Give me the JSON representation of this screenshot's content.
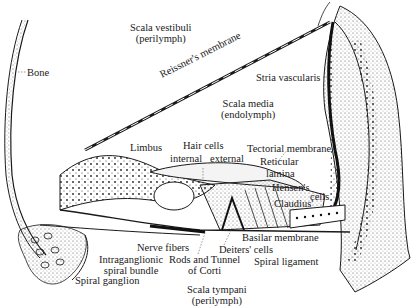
{
  "diagram": {
    "colors": {
      "ink": "#1a1a1a",
      "background": "#ffffff",
      "stipple": "#333333"
    },
    "compartments": [
      {
        "name": "Scala vestibuli",
        "fluid": "(perilymph)"
      },
      {
        "name": "Scala media",
        "fluid": "(endolymph)"
      },
      {
        "name": "Scala tympani",
        "fluid": "(perilymph)"
      }
    ],
    "labels": {
      "bone": "Bone",
      "reissners_membrane": "Reissner's membrane",
      "stria_vascularis": "Stria vascularis",
      "limbus": "Limbus",
      "hair_cells": "Hair cells",
      "internal": "internal",
      "external": "external",
      "tectorial_membrane": "Tectorial membrane",
      "reticular": "Reticular",
      "lamina": "lamina",
      "hensens": "Hensen's",
      "cells": "cells",
      "claudius": "Claudius'",
      "basilar_membrane": "Basilar membrane",
      "deiters_cells": "Deiters' cells",
      "spiral_ligament": "Spiral ligament",
      "nerve_fibers": "Nerve fibers",
      "intraganglionic_1": "Intraganglionic",
      "intraganglionic_2": "spiral bundle",
      "rods_tunnel_1": "Rods and Tunnel",
      "rods_tunnel_2": "of Corti",
      "spiral_ganglion": "Spiral ganglion"
    }
  }
}
